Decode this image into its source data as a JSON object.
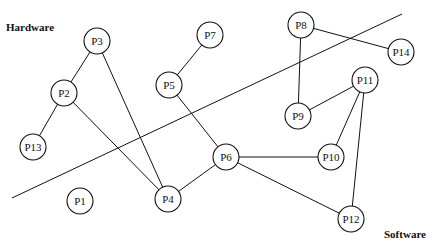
{
  "diagram": {
    "regions": [
      {
        "id": "hardware",
        "label": "Hardware",
        "x": 6,
        "y": 31
      },
      {
        "id": "software",
        "label": "Software",
        "x": 384,
        "y": 238
      }
    ],
    "divider": {
      "x1": 12,
      "y1": 198,
      "x2": 402,
      "y2": 14
    },
    "node_radius": 13,
    "nodes": [
      {
        "id": "P1",
        "label": "P1",
        "x": 80,
        "y": 201
      },
      {
        "id": "P2",
        "label": "P2",
        "x": 64,
        "y": 93
      },
      {
        "id": "P3",
        "label": "P3",
        "x": 97,
        "y": 41
      },
      {
        "id": "P4",
        "label": "P4",
        "x": 168,
        "y": 199
      },
      {
        "id": "P5",
        "label": "P5",
        "x": 169,
        "y": 85
      },
      {
        "id": "P6",
        "label": "P6",
        "x": 226,
        "y": 157
      },
      {
        "id": "P7",
        "label": "P7",
        "x": 210,
        "y": 35
      },
      {
        "id": "P8",
        "label": "P8",
        "x": 301,
        "y": 25
      },
      {
        "id": "P9",
        "label": "P9",
        "x": 298,
        "y": 116
      },
      {
        "id": "P10",
        "label": "P10",
        "x": 331,
        "y": 157
      },
      {
        "id": "P11",
        "label": "P11",
        "x": 365,
        "y": 80
      },
      {
        "id": "P12",
        "label": "P12",
        "x": 351,
        "y": 219
      },
      {
        "id": "P13",
        "label": "P13",
        "x": 33,
        "y": 147
      },
      {
        "id": "P14",
        "label": "P14",
        "x": 401,
        "y": 52
      }
    ],
    "edges": [
      [
        "P3",
        "P2"
      ],
      [
        "P2",
        "P13"
      ],
      [
        "P2",
        "P4"
      ],
      [
        "P3",
        "P4"
      ],
      [
        "P4",
        "P6"
      ],
      [
        "P5",
        "P7"
      ],
      [
        "P5",
        "P6"
      ],
      [
        "P6",
        "P10"
      ],
      [
        "P6",
        "P12"
      ],
      [
        "P8",
        "P9"
      ],
      [
        "P8",
        "P14"
      ],
      [
        "P9",
        "P11"
      ],
      [
        "P11",
        "P10"
      ],
      [
        "P11",
        "P12"
      ]
    ]
  }
}
